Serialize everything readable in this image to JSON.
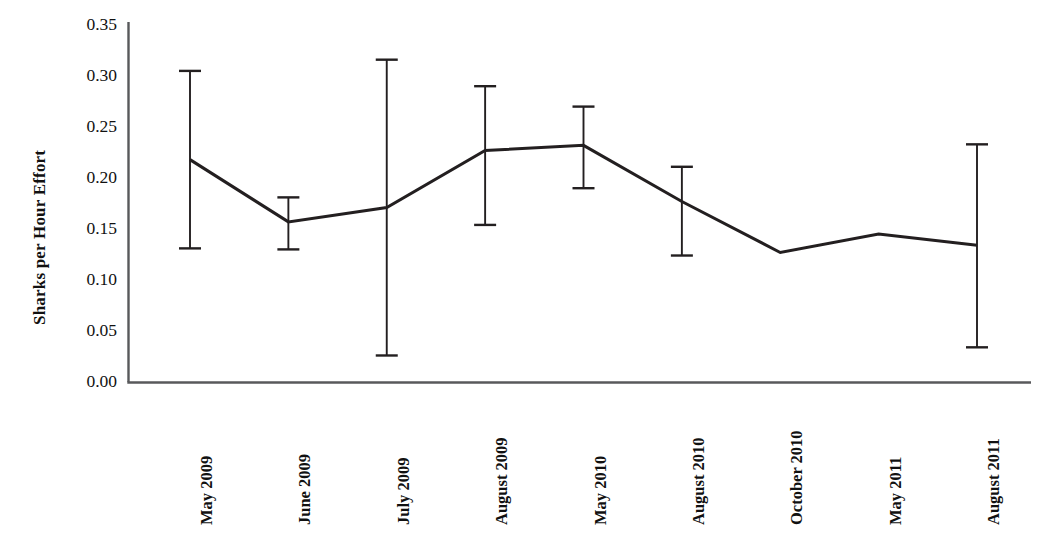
{
  "chart_data": {
    "type": "line",
    "title": "",
    "xlabel": "",
    "ylabel": "Sharks per Hour Effort",
    "ylim": [
      0.0,
      0.35
    ],
    "ytick_labels": [
      "0.00",
      "0.05",
      "0.10",
      "0.15",
      "0.20",
      "0.25",
      "0.30",
      "0.35"
    ],
    "ytick_values": [
      0.0,
      0.05,
      0.1,
      0.15,
      0.2,
      0.25,
      0.3,
      0.35
    ],
    "grid": false,
    "legend": "none",
    "categories": [
      "May 2009",
      "June 2009",
      "July 2009",
      "August 2009",
      "May 2010",
      "August 2010",
      "October 2010",
      "May 2011",
      "August 2011"
    ],
    "series": [
      {
        "name": "Sharks per Hour Effort",
        "values": [
          0.218,
          0.157,
          0.171,
          0.227,
          0.232,
          0.177,
          0.127,
          0.145,
          0.134
        ],
        "error_upper": [
          0.305,
          0.181,
          0.316,
          0.29,
          0.27,
          0.211,
          null,
          null,
          0.233
        ],
        "error_lower": [
          0.131,
          0.13,
          0.026,
          0.154,
          0.19,
          0.124,
          null,
          null,
          0.034
        ],
        "color": "#231f20",
        "line_width": 3,
        "marker": "none"
      }
    ],
    "error_bar_color": "#231f20",
    "axis_color": "#58595b",
    "background_color": "#ffffff"
  }
}
